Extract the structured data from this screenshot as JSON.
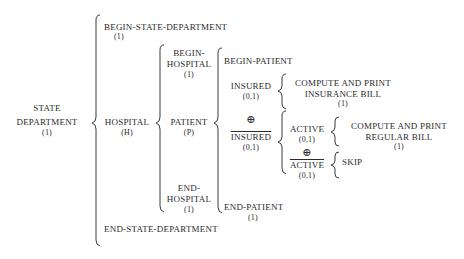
{
  "diagram": {
    "type": "warnier-orr",
    "root": {
      "label_line1": "STATE",
      "label_line2": "DEPARTMENT",
      "count": "(1)"
    },
    "level1": {
      "begin": {
        "label": "BEGIN-STATE-DEPARTMENT",
        "count": "(1)"
      },
      "hospital": {
        "label": "HOSPITAL",
        "count": "(H)"
      },
      "end": {
        "label": "END-STATE-DEPARTMENT"
      }
    },
    "level2": {
      "begin": {
        "line1": "BEGIN-",
        "line2": "HOSPITAL",
        "count": "(1)"
      },
      "patient": {
        "label": "PATIENT",
        "count": "(P)"
      },
      "end": {
        "line1": "END-",
        "line2": "HOSPITAL",
        "count": "(1)"
      }
    },
    "level3": {
      "begin": {
        "label": "BEGIN-PATIENT"
      },
      "insured": {
        "label": "INSURED",
        "count": "(0,1)"
      },
      "xor": "⊕",
      "not_insured": {
        "label": "INSURED",
        "count": "(0,1)"
      },
      "end": {
        "label": "END-PATIENT",
        "count": "(1)"
      }
    },
    "insured_action": {
      "line1": "COMPUTE AND PRINT",
      "line2": "INSURANCE BILL",
      "count": "(1)"
    },
    "level4": {
      "active": {
        "label": "ACTIVE",
        "count": "(0,1)"
      },
      "xor": "⊕",
      "not_active": {
        "label": "ACTIVE",
        "count": "(0,1)"
      }
    },
    "active_action": {
      "line1": "COMPUTE AND PRINT",
      "line2": "REGULAR BILL",
      "count": "(1)"
    },
    "not_active_action": {
      "label": "SKIP"
    }
  }
}
